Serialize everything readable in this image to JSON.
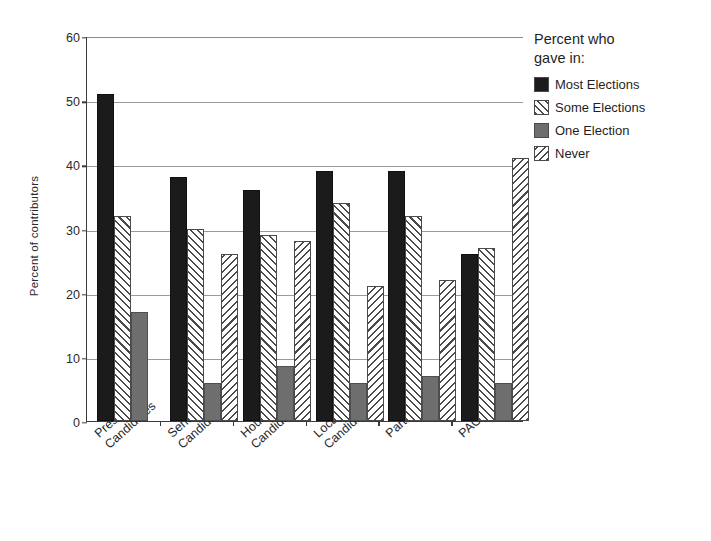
{
  "chart_data": {
    "type": "bar",
    "title": "",
    "xlabel": "",
    "ylabel": "Percent of contributors",
    "ylim": [
      0,
      60
    ],
    "yticks": [
      0,
      10,
      20,
      30,
      40,
      50,
      60
    ],
    "grid": "horizontal",
    "legend_position": "top-right",
    "legend_title_line1": "Percent who",
    "legend_title_line2": "gave in:",
    "categories": [
      "President'l Candidates",
      "Senate Candidates",
      "House Candidates",
      "Local Candidates",
      "Parties",
      "PACs"
    ],
    "category_lines": [
      [
        "President'l",
        "Candidates"
      ],
      [
        "Senate",
        "Candidates"
      ],
      [
        "House",
        "Candidates"
      ],
      [
        "Local",
        "Candidates"
      ],
      [
        "Parties"
      ],
      [
        "PACs"
      ]
    ],
    "series": [
      {
        "name": "Most Elections",
        "key": "most",
        "fill": "solid-black",
        "color": "#1b1b1b",
        "values": [
          51,
          38,
          36,
          39,
          39,
          26
        ]
      },
      {
        "name": "Some Elections",
        "key": "some",
        "fill": "backslash-hatch",
        "color": "#4a4a4a",
        "values": [
          32,
          30,
          29,
          34,
          32,
          27
        ]
      },
      {
        "name": "One Election",
        "key": "one",
        "fill": "solid-gray",
        "color": "#6e6e6e",
        "values": [
          17,
          6,
          8.5,
          6,
          7,
          6
        ]
      },
      {
        "name": "Never",
        "key": "never",
        "fill": "forwardslash-hatch",
        "color": "#4a4a4a",
        "values": [
          null,
          26,
          28,
          21,
          22,
          41
        ]
      }
    ]
  }
}
